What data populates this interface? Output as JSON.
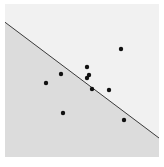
{
  "diagram": {
    "type": "scatter-with-decision-boundary",
    "frame": {
      "x": 5,
      "y": 4,
      "width": 154,
      "height": 153
    },
    "colors": {
      "background": "#ffffff",
      "region_upper": "#f1f1f1",
      "region_lower": "#dcdcdc",
      "line": "#3a3a3a",
      "point": "#111111"
    },
    "boundary_line": {
      "x1": 6,
      "y1": 23,
      "x2": 159,
      "y2": 138
    },
    "points": [
      {
        "x": 121,
        "y": 49
      },
      {
        "x": 87,
        "y": 67
      },
      {
        "x": 89,
        "y": 75
      },
      {
        "x": 87,
        "y": 78
      },
      {
        "x": 61,
        "y": 74
      },
      {
        "x": 46,
        "y": 83
      },
      {
        "x": 92,
        "y": 89
      },
      {
        "x": 109,
        "y": 90
      },
      {
        "x": 63,
        "y": 113
      },
      {
        "x": 124,
        "y": 120
      }
    ],
    "point_radius": 2.2
  }
}
